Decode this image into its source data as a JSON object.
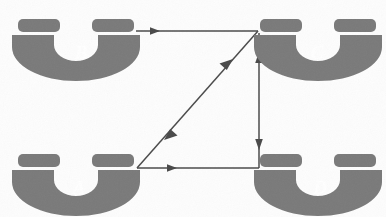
{
  "figure": {
    "title_fragment": "graph theory",
    "background_color": "#fdfdfd",
    "node_fill_color": "#7a7a7a",
    "node_label_color": "#ffffff",
    "edge_color": "#4a4a4a",
    "caption_color": "#2b2b2b"
  },
  "nodes": [
    {
      "id": "B",
      "label": "B",
      "position": "top-left",
      "cx": 76,
      "cy": 45,
      "label_x": 81,
      "label_y": 55
    },
    {
      "id": "C",
      "label": "C",
      "position": "top-right",
      "cx": 318,
      "cy": 45,
      "label_x": 317,
      "label_y": 55
    },
    {
      "id": "A",
      "label": "A",
      "position": "bottom-left",
      "cx": 76,
      "cy": 180,
      "label_x": 79,
      "label_y": 190
    },
    {
      "id": "D",
      "label": "D",
      "position": "bottom-right",
      "cx": 318,
      "cy": 180,
      "label_x": 320,
      "label_y": 190
    }
  ],
  "edges": [
    {
      "id": "edge-b-c",
      "from": "B",
      "to": "C",
      "direction": "one-way",
      "arrowheads": "forward",
      "x1": 136,
      "y1": 31,
      "x2": 258,
      "y2": 31
    },
    {
      "id": "edge-a-c",
      "from": "A",
      "to": "C",
      "direction": "two-way",
      "arrowheads": "both",
      "x1": 137,
      "y1": 168,
      "x2": 258,
      "y2": 31
    },
    {
      "id": "edge-c-d",
      "from": "C",
      "to": "D",
      "direction": "two-way",
      "arrowheads": "both",
      "x1": 259,
      "y1": 33,
      "x2": 259,
      "y2": 168
    },
    {
      "id": "edge-a-d",
      "from": "A",
      "to": "D",
      "direction": "one-way",
      "arrowheads": "forward",
      "x1": 137,
      "y1": 168,
      "x2": 259,
      "y2": 168
    }
  ]
}
